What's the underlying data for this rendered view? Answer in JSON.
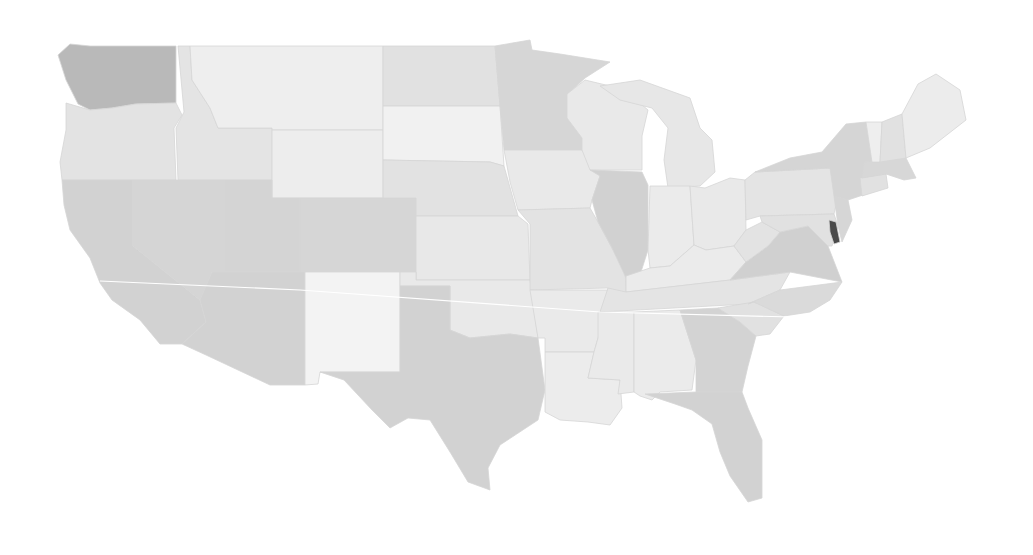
{
  "map": {
    "type": "choropleth",
    "region": "Contiguous United States",
    "palette": {
      "background": "#ffffff",
      "lightest": "#f1f1f1",
      "light": "#e8e8e8",
      "mid_light": "#e0e0e0",
      "mid": "#d7d7d7",
      "mid_dark": "#cfcfcf",
      "dark": "#b4b4b4",
      "darkest": "#4a4a4a"
    },
    "states": [
      {
        "id": "WA",
        "shade": "#b9b9b9",
        "d": "M58,55 L70,44 L90,46 L176,46 L176,103 L136,104 L112,108 L90,110 L78,104 L66,80 Z"
      },
      {
        "id": "OR",
        "shade": "#e3e3e3",
        "d": "M66,103 L90,110 L112,108 L136,104 L176,103 L182,115 L174,128 L176,180 L62,180 L60,162 L66,130 Z"
      },
      {
        "id": "CA",
        "shade": "#d2d2d2",
        "d": "M62,180 L133,180 L133,246 L200,300 L206,322 L182,344 L160,344 L140,320 L112,300 L100,283 L90,258 L70,230 L64,205 Z"
      },
      {
        "id": "ID",
        "shade": "#e4e4e4",
        "d": "M178,46 L190,46 L192,80 L210,108 L218,128 L272,128 L272,180 L178,180 L176,128 L184,112 Z"
      },
      {
        "id": "NV",
        "shade": "#d5d5d5",
        "d": "M133,180 L225,180 L225,272 L212,272 L200,300 L133,246 Z"
      },
      {
        "id": "MT",
        "shade": "#eeeeee",
        "d": "M190,46 L383,46 L383,130 L272,130 L272,128 L218,128 L210,108 L192,80 Z"
      },
      {
        "id": "WY",
        "shade": "#ededed",
        "d": "M272,130 L383,130 L383,198 L272,198 Z"
      },
      {
        "id": "UT",
        "shade": "#d4d4d4",
        "d": "M225,180 L272,180 L272,198 L300,198 L300,272 L225,272 Z"
      },
      {
        "id": "AZ",
        "shade": "#d2d2d2",
        "d": "M212,272 L305,272 L305,385 L270,385 L206,355 L182,344 L206,322 L200,300 Z"
      },
      {
        "id": "CO",
        "shade": "#d6d6d6",
        "d": "M300,198 L416,198 L416,272 L300,272 Z"
      },
      {
        "id": "NM",
        "shade": "#f3f3f3",
        "d": "M305,272 L400,272 L400,372 L320,372 L318,384 L305,385 Z"
      },
      {
        "id": "ND",
        "shade": "#e1e1e1",
        "d": "M383,46 L495,46 L500,106 L383,106 Z"
      },
      {
        "id": "SD",
        "shade": "#f1f1f1",
        "d": "M383,106 L500,106 L504,166 L490,162 L383,160 Z"
      },
      {
        "id": "NE",
        "shade": "#e2e2e2",
        "d": "M383,160 L490,162 L504,166 L518,216 L416,216 L416,198 L383,198 Z"
      },
      {
        "id": "KS",
        "shade": "#e8e8e8",
        "d": "M416,216 L518,216 L528,224 L530,280 L416,280 Z"
      },
      {
        "id": "OK",
        "shade": "#e9e9e9",
        "d": "M400,272 L416,272 L416,280 L530,280 L538,338 L510,334 L470,338 L450,330 L450,286 L400,286 Z"
      },
      {
        "id": "TX",
        "shade": "#d2d2d2",
        "d": "M400,286 L450,286 L450,330 L470,338 L510,334 L538,338 L545,390 L538,420 L500,445 L488,468 L490,490 L468,482 L450,452 L430,420 L408,418 L390,428 L372,410 L344,380 L320,372 L400,372 Z"
      },
      {
        "id": "MN",
        "shade": "#d6d6d6",
        "d": "M495,46 L530,40 L532,50 L560,54 L610,62 L585,78 L570,92 L567,118 L582,138 L582,150 L504,150 L500,106 Z"
      },
      {
        "id": "IA",
        "shade": "#e9e9e9",
        "d": "M504,150 L582,150 L590,162 L600,176 L592,200 L590,208 L518,210 L510,182 Z"
      },
      {
        "id": "MO",
        "shade": "#e3e3e3",
        "d": "M518,210 L590,208 L598,222 L612,248 L625,268 L626,294 L608,298 L608,288 L530,290 L530,224 Z"
      },
      {
        "id": "AR",
        "shade": "#eaeaea",
        "d": "M530,290 L608,290 L605,310 L598,338 L594,352 L545,352 L545,338 L538,338 Z"
      },
      {
        "id": "LA",
        "shade": "#ececec",
        "d": "M545,352 L594,352 L588,378 L620,380 L622,408 L610,425 L588,422 L560,420 L545,412 L545,390 Z"
      },
      {
        "id": "WI",
        "shade": "#e9e9e9",
        "d": "M567,94 L585,80 L610,86 L634,98 L648,110 L642,136 L642,170 L590,170 L582,150 L582,138 L567,118 Z"
      },
      {
        "id": "IL",
        "shade": "#d1d1d1",
        "d": "M590,170 L642,172 L648,185 L648,250 L640,275 L628,282 L612,248 L598,222 L592,200 L600,176 Z"
      },
      {
        "id": "MI",
        "shade": "#e7e7e7",
        "d": "M600,86 L640,80 L690,98 L700,128 L712,140 L715,172 L700,186 L668,188 L664,160 L668,128 L652,108 L620,100 Z"
      },
      {
        "id": "IN",
        "shade": "#ebebeb",
        "d": "M650,186 L690,186 L694,245 L670,266 L650,268 L648,250 Z"
      },
      {
        "id": "OH",
        "shade": "#e9e9e9",
        "d": "M690,186 L705,188 L730,178 L745,180 L746,230 L734,246 L706,250 L694,245 Z"
      },
      {
        "id": "KY",
        "shade": "#ebebeb",
        "d": "M626,276 L650,268 L670,266 L694,245 L706,250 L734,246 L746,262 L730,280 L626,292 Z"
      },
      {
        "id": "TN",
        "shade": "#e4e4e4",
        "d": "M608,288 L626,292 L730,280 L790,272 L780,290 L748,304 L600,312 Z"
      },
      {
        "id": "MS",
        "shade": "#eaeaea",
        "d": "M598,312 L634,312 L634,392 L618,394 L620,380 L588,378 L594,352 L598,338 Z"
      },
      {
        "id": "AL",
        "shade": "#ebebeb",
        "d": "M634,312 L680,310 L696,360 L692,390 L660,392 L652,400 L640,396 L634,392 Z"
      },
      {
        "id": "GA",
        "shade": "#d3d3d3",
        "d": "M680,310 L718,308 L740,322 L756,336 L748,366 L742,392 L720,394 L696,392 L696,360 Z"
      },
      {
        "id": "FL",
        "shade": "#d2d2d2",
        "d": "M645,394 L696,392 L742,392 L748,408 L762,440 L762,498 L748,502 L730,476 L720,452 L712,424 L692,410 L675,404 Z"
      },
      {
        "id": "SC",
        "shade": "#e1e1e1",
        "d": "M718,308 L754,302 L784,316 L770,334 L756,336 L740,322 Z"
      },
      {
        "id": "NC",
        "shade": "#dadada",
        "d": "M748,304 L780,290 L842,282 L830,300 L810,312 L784,316 L754,302 Z"
      },
      {
        "id": "VA",
        "shade": "#d0d0d0",
        "d": "M730,280 L746,262 L768,246 L780,232 L808,226 L828,246 L842,282 L790,272 Z"
      },
      {
        "id": "WV",
        "shade": "#e3e3e3",
        "d": "M734,246 L746,230 L762,222 L780,232 L768,246 L746,262 Z"
      },
      {
        "id": "PA",
        "shade": "#e4e4e4",
        "d": "M745,180 L755,172 L830,168 L840,186 L834,214 L760,216 L746,220 Z"
      },
      {
        "id": "MD",
        "shade": "#e1e1e1",
        "d": "M760,216 L834,214 L838,226 L832,246 L828,246 L808,226 L780,232 L762,222 Z"
      },
      {
        "id": "DE",
        "shade": "#4a4a4a",
        "d": "M829,220 L836,222 L840,242 L834,244 L830,232 Z"
      },
      {
        "id": "NJ",
        "shade": "#d6d6d6",
        "d": "M834,196 L848,200 L852,220 L842,242 L838,226 Z"
      },
      {
        "id": "NY",
        "shade": "#d5d5d5",
        "d": "M755,172 L790,158 L822,152 L846,124 L866,122 L872,160 L878,190 L860,196 L848,200 L834,196 L830,168 Z"
      },
      {
        "id": "CT",
        "shade": "#e1e1e1",
        "d": "M860,178 L886,174 L888,188 L862,196 Z"
      },
      {
        "id": "MA",
        "shade": "#d7d7d7",
        "d": "M864,162 L906,158 L916,178 L904,180 L886,174 L862,178 Z"
      },
      {
        "id": "VT",
        "shade": "#eeeeee",
        "d": "M866,122 L882,122 L880,162 L872,162 Z"
      },
      {
        "id": "NH",
        "shade": "#e1e1e1",
        "d": "M882,122 L902,114 L906,158 L880,162 Z"
      },
      {
        "id": "ME",
        "shade": "#ececec",
        "d": "M902,114 L918,84 L936,74 L960,90 L966,120 L930,148 L906,158 Z"
      }
    ],
    "seams": [
      {
        "id": "seam-line",
        "d": "M100,281 L300,290 L600,312 L830,318"
      }
    ]
  }
}
